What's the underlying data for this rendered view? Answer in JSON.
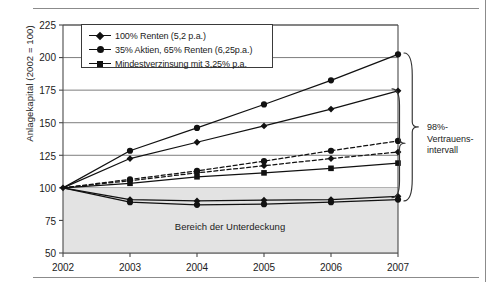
{
  "chart_data": {
    "type": "line",
    "title": "",
    "xlabel": "",
    "ylabel": "Anlagekapital (2002 = 100)",
    "x": [
      2002,
      2003,
      2004,
      2005,
      2006,
      2007
    ],
    "xticklabels": [
      "2002",
      "2003",
      "2004",
      "2005",
      "2006",
      "2007"
    ],
    "yticklabels": [
      "50",
      "75",
      "100",
      "125",
      "150",
      "175",
      "200",
      "225"
    ],
    "yticks": [
      50,
      75,
      100,
      125,
      150,
      175,
      200,
      225
    ],
    "ylim": [
      50,
      225
    ],
    "grid": "horizontal",
    "legend_position": "upper-left-inside",
    "series": [
      {
        "name": "35% Aktien, 65% Renten (6,25p.a.) – oberes Vertrauensband",
        "marker": "circle",
        "style": "solid",
        "values": [
          100,
          128.5,
          146,
          164,
          182.5,
          202.5
        ]
      },
      {
        "name": "100% Renten (5,2 p.a.) – oberes Vertrauensband",
        "marker": "diamond",
        "style": "solid",
        "values": [
          100,
          122.5,
          135,
          147.5,
          160.5,
          174.5
        ]
      },
      {
        "name": "35% Aktien, 65% Renten (6,25p.a.) – Erwartungswert",
        "marker": "circle",
        "style": "dashed",
        "values": [
          100,
          106.5,
          113,
          120.5,
          128.5,
          136
        ]
      },
      {
        "name": "100% Renten (5,2 p.a.) – Erwartungswert",
        "marker": "diamond",
        "style": "dashed",
        "values": [
          100,
          105.5,
          111.5,
          117,
          122.5,
          127.5
        ]
      },
      {
        "name": "Mindestverzinsung mit 3,25% p.a.",
        "marker": "square",
        "style": "solid",
        "values": [
          100,
          103.5,
          108.5,
          111.5,
          115,
          119
        ]
      },
      {
        "name": "100% Renten (5,2 p.a.) – unteres Vertrauensband",
        "marker": "diamond",
        "style": "solid",
        "values": [
          100,
          91,
          90,
          90.5,
          91,
          93.5
        ]
      },
      {
        "name": "35% Aktien, 65% Renten (6,25p.a.) – unteres Vertrauensband",
        "marker": "circle",
        "style": "solid",
        "values": [
          100,
          89,
          87,
          87.5,
          89,
          91
        ]
      }
    ],
    "shaded_region": {
      "label": "Bereich der Unterdeckung",
      "from": 50,
      "to": 100,
      "color": "#e3e3e3"
    },
    "annotations": [
      {
        "name": "confidence-interval-brace",
        "text": "98%-\nVertrauens-\nintervall",
        "lines": [
          "98%-",
          "Vertrauens-",
          "intervall"
        ]
      }
    ]
  },
  "legend": {
    "items": [
      {
        "label": "100% Renten (5,2 p.a.)",
        "marker": "diamond",
        "style": "solid"
      },
      {
        "label": "35% Aktien, 65% Renten (6,25p.a.)",
        "marker": "circle",
        "style": "solid"
      },
      {
        "label": "Mindestverzinsung mit 3,25% p.a.",
        "marker": "square",
        "style": "solid"
      }
    ]
  },
  "axes": {
    "y_title": "Anlagekapital (2002 = 100)",
    "y_ticks": [
      "225",
      "200",
      "175",
      "150",
      "125",
      "100",
      "75",
      "50"
    ],
    "x_ticks": [
      "2002",
      "2003",
      "2004",
      "2005",
      "2006",
      "2007"
    ]
  },
  "annotation": {
    "line1": "98%-",
    "line2": "Vertrauens-",
    "line3": "intervall"
  },
  "band": {
    "label": "Bereich der Unterdeckung"
  },
  "colors": {
    "ink": "#1b1b1b",
    "line": "#111111",
    "shade": "#e3e3e3",
    "grid": "#6f6f6f",
    "rule": "#8b8b8b"
  }
}
